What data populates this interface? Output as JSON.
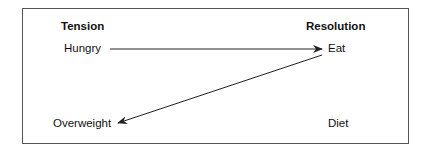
{
  "diagram": {
    "columns": {
      "left_header": "Tension",
      "right_header": "Resolution"
    },
    "nodes": {
      "hungry": "Hungry",
      "eat": "Eat",
      "overweight": "Overweight",
      "diet": "Diet"
    },
    "edges": [
      {
        "from": "Hungry",
        "to": "Eat"
      },
      {
        "from": "Eat",
        "to": "Overweight"
      }
    ],
    "colors": {
      "border": "#555555",
      "arrow": "#222222",
      "text": "#111111"
    }
  }
}
